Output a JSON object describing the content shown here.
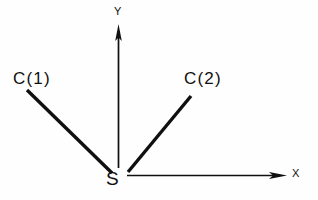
{
  "figure": {
    "background_color": "#fefefe",
    "stroke_color": "#101010",
    "axes": {
      "y_axis": {
        "label": "Y",
        "icon": "up-arrow-icon",
        "origin": [
          118,
          168
        ],
        "tip": [
          118,
          25
        ],
        "line_width": 1.6,
        "arrowhead": "long-slender"
      },
      "x_axis": {
        "label": "X",
        "icon": "right-arrow-icon",
        "origin": [
          127,
          175
        ],
        "tip": [
          286,
          175
        ],
        "line_width": 1.6,
        "arrowhead": "long-slender"
      }
    },
    "origin_point": {
      "label": "S",
      "position": [
        118,
        178
      ]
    },
    "rays": [
      {
        "label": "C(1)",
        "from": [
          113,
          173
        ],
        "to": [
          27,
          91
        ],
        "line_width": 3.4,
        "quadrant": "upper-left"
      },
      {
        "label": "C(2)",
        "from": [
          128,
          172
        ],
        "to": [
          191,
          96
        ],
        "line_width": 3.4,
        "quadrant": "upper-right"
      }
    ]
  }
}
